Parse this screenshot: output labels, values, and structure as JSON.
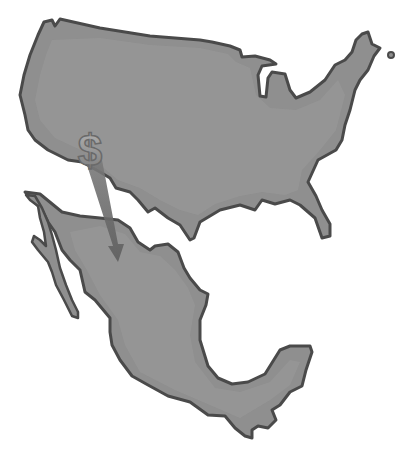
{
  "map": {
    "description": "Stylized grayscale map of the United States and Mexico with a dollar sign arrow pointing from the U.S. southwest into northern Mexico",
    "regions": [
      {
        "name": "United States",
        "fill": "#8f8f8f"
      },
      {
        "name": "Mexico",
        "fill": "#8f8f8f"
      }
    ],
    "symbol": {
      "glyph": "$",
      "color": "#9a9a9a"
    },
    "colors": {
      "land_fill": "#8f8f8f",
      "land_inner": "#9b9b9b",
      "outline": "#4a4a4a",
      "arrow": "#6e6e6e",
      "background": "#ffffff"
    }
  }
}
